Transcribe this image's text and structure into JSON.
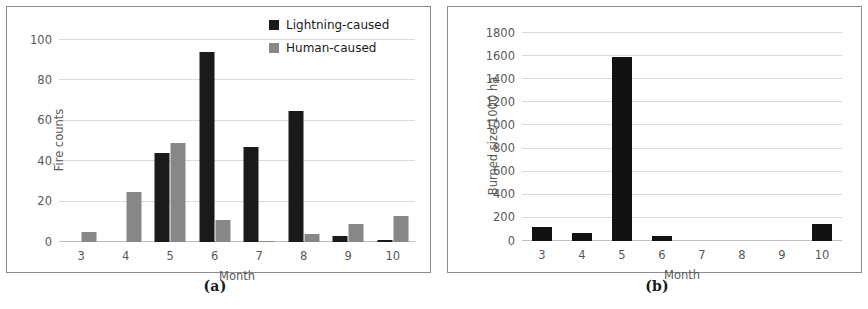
{
  "figure": {
    "panels": [
      {
        "caption": "(a)"
      },
      {
        "caption": "(b)"
      }
    ]
  },
  "chart_data": [
    {
      "panel": "a",
      "caption": "(a)",
      "type": "bar",
      "title": "",
      "xlabel": "Month",
      "ylabel": "Fire counts",
      "categories": [
        "3",
        "4",
        "5",
        "6",
        "7",
        "8",
        "9",
        "10"
      ],
      "series": [
        {
          "name": "Lightning-caused",
          "color": "#1a1a1a",
          "values": [
            0,
            0,
            44,
            94,
            47,
            65,
            3,
            1
          ]
        },
        {
          "name": "Human-caused",
          "color": "#878787",
          "values": [
            5,
            25,
            49,
            11,
            0.5,
            4,
            9,
            13
          ]
        }
      ],
      "legend": [
        "Lightning-caused",
        "Human-caused"
      ],
      "legend_position": "top-right",
      "ylim": [
        0,
        100
      ],
      "yticks": [
        0,
        20,
        40,
        60,
        80,
        100
      ],
      "ytick_labels": [
        "0",
        "20",
        "40",
        "60",
        "80",
        "100"
      ],
      "grid": true,
      "grid_axis": "y"
    },
    {
      "panel": "b",
      "caption": "(b)",
      "type": "bar",
      "title": "",
      "xlabel": "Month",
      "ylabel": "Burned size/1000 ha",
      "categories": [
        "3",
        "4",
        "5",
        "6",
        "7",
        "8",
        "9",
        "10"
      ],
      "values": [
        120,
        70,
        1590,
        40,
        0,
        0,
        0,
        150
      ],
      "series": [
        {
          "name": "Burned size",
          "color": "#121212",
          "values": [
            120,
            70,
            1590,
            40,
            0,
            0,
            0,
            150
          ]
        }
      ],
      "legend": [],
      "ylim": [
        0,
        1800
      ],
      "yticks": [
        0,
        200,
        400,
        600,
        800,
        1000,
        1200,
        1400,
        1600,
        1800
      ],
      "ytick_labels": [
        "0",
        "200",
        "400",
        "600",
        "800",
        "1000",
        "1200",
        "1400",
        "1600",
        "1800"
      ],
      "grid": true,
      "grid_axis": "y"
    }
  ]
}
